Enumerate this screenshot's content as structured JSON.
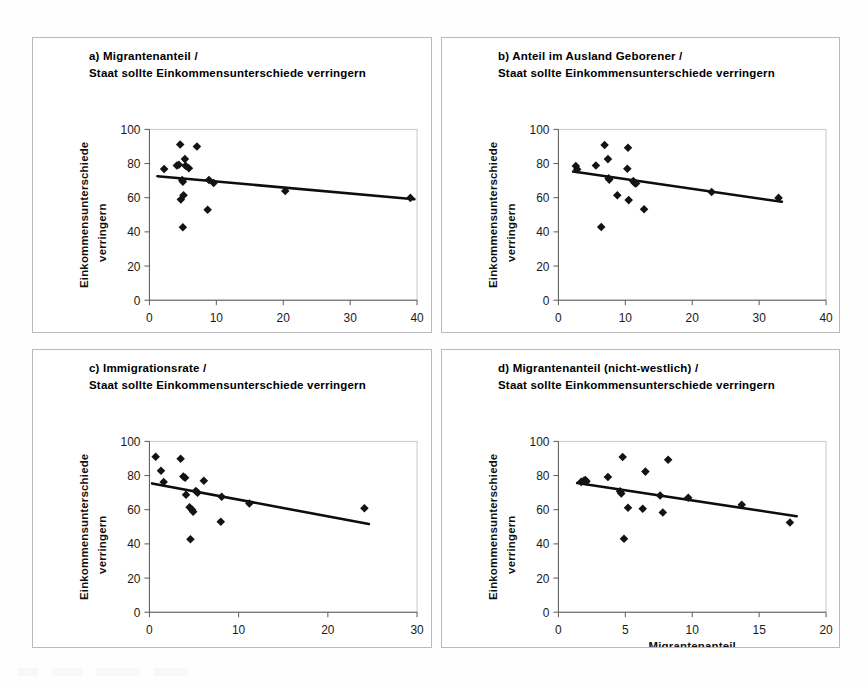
{
  "figure": {
    "background_color": "#ffffff",
    "panel_border_color": "#b9b9b9",
    "marker_color": "#131313",
    "trend_color": "#0d0d0d",
    "axis_color": "#5a5a5a"
  },
  "panels": {
    "a": {
      "title_line1": "a) Migrantenanteil /",
      "title_line2": "Staat sollte Einkommensunterschiede verringern",
      "xlabel": "Migrantenanteil (in %)",
      "ylabel_line1": "Einkommensunterschiede",
      "ylabel_line2": "verringern",
      "xticks": [
        "0",
        "10",
        "20",
        "30",
        "40"
      ],
      "yticks": [
        "0",
        "20",
        "40",
        "60",
        "80",
        "100"
      ]
    },
    "b": {
      "title_line1": "b) Anteil im Ausland Geborener /",
      "title_line2": "Staat sollte Einkommensunterschiede verringern",
      "xlabel": "Anteil im Ausland Geborener (in %)",
      "ylabel_line1": "Einkommensunterschiede",
      "ylabel_line2": "verringern",
      "xticks": [
        "0",
        "10",
        "20",
        "30",
        "40"
      ],
      "yticks": [
        "0",
        "20",
        "40",
        "60",
        "80",
        "100"
      ]
    },
    "c": {
      "title_line1": "c) Immigrationsrate /",
      "title_line2": "Staat sollte Einkommensunterschiede verringern",
      "xlabel": "Immigrationsrate (in ‰)",
      "ylabel_line1": "Einkommensunterschiede",
      "ylabel_line2": "verringern",
      "xticks": [
        "0",
        "10",
        "20",
        "30"
      ],
      "yticks": [
        "0",
        "20",
        "40",
        "60",
        "80",
        "100"
      ]
    },
    "d": {
      "title_line1": "d) Migrantenanteil (nicht-westlich) /",
      "title_line2": "Staat sollte Einkommensunterschiede verringern",
      "xlabel_line1": "Migrantenanteil",
      "xlabel_line2": "Herkunftsländer nicht-westlich (in %)",
      "ylabel_line1": "Einkommensunterschiede",
      "ylabel_line2": "verringern",
      "xticks": [
        "0",
        "5",
        "10",
        "15",
        "20"
      ],
      "yticks": [
        "0",
        "20",
        "40",
        "60",
        "80",
        "100"
      ]
    }
  },
  "chart_data": [
    {
      "id": "a",
      "type": "scatter",
      "title": "a) Migrantenanteil / Staat sollte Einkommensunterschiede verringern",
      "xlabel": "Migrantenanteil (in %)",
      "ylabel": "Einkommensunterschiede verringern",
      "xlim": [
        0,
        40
      ],
      "ylim": [
        0,
        100
      ],
      "xticks": [
        0,
        10,
        20,
        30,
        40
      ],
      "yticks": [
        0,
        20,
        40,
        60,
        80,
        100
      ],
      "grid": false,
      "legend": "none",
      "points": [
        {
          "x": 2.2,
          "y": 76.8
        },
        {
          "x": 4.1,
          "y": 78.8
        },
        {
          "x": 4.4,
          "y": 79.3
        },
        {
          "x": 4.6,
          "y": 91.2
        },
        {
          "x": 4.7,
          "y": 58.9
        },
        {
          "x": 4.9,
          "y": 70.3
        },
        {
          "x": 5.0,
          "y": 69.4
        },
        {
          "x": 5.0,
          "y": 42.7
        },
        {
          "x": 5.1,
          "y": 61.4
        },
        {
          "x": 5.3,
          "y": 82.6
        },
        {
          "x": 5.4,
          "y": 78.7
        },
        {
          "x": 5.9,
          "y": 77.3
        },
        {
          "x": 7.1,
          "y": 90.0
        },
        {
          "x": 8.7,
          "y": 52.9
        },
        {
          "x": 8.9,
          "y": 70.4
        },
        {
          "x": 9.6,
          "y": 68.6
        },
        {
          "x": 20.3,
          "y": 63.9
        },
        {
          "x": 39.0,
          "y": 59.9
        }
      ],
      "trendline": {
        "x0": 1.2,
        "y0": 72.6,
        "x1": 39.6,
        "y1": 59.1
      }
    },
    {
      "id": "b",
      "type": "scatter",
      "title": "b) Anteil im Ausland Geborener / Staat sollte Einkommensunterschiede verringern",
      "xlabel": "Anteil im Ausland Geborener (in %)",
      "ylabel": "Einkommensunterschiede verringern",
      "xlim": [
        0,
        40
      ],
      "ylim": [
        0,
        100
      ],
      "xticks": [
        0,
        10,
        20,
        30,
        40
      ],
      "yticks": [
        0,
        20,
        40,
        60,
        80,
        100
      ],
      "grid": false,
      "legend": "none",
      "points": [
        {
          "x": 2.6,
          "y": 78.6
        },
        {
          "x": 2.8,
          "y": 76.7
        },
        {
          "x": 5.6,
          "y": 78.9
        },
        {
          "x": 6.4,
          "y": 42.8
        },
        {
          "x": 6.9,
          "y": 90.9
        },
        {
          "x": 7.4,
          "y": 82.6
        },
        {
          "x": 7.5,
          "y": 71.4
        },
        {
          "x": 7.6,
          "y": 70.6
        },
        {
          "x": 8.8,
          "y": 61.5
        },
        {
          "x": 10.3,
          "y": 77.0
        },
        {
          "x": 10.4,
          "y": 89.3
        },
        {
          "x": 10.5,
          "y": 58.6
        },
        {
          "x": 11.2,
          "y": 69.7
        },
        {
          "x": 11.4,
          "y": 68.6
        },
        {
          "x": 11.6,
          "y": 68.3
        },
        {
          "x": 12.8,
          "y": 53.3
        },
        {
          "x": 22.9,
          "y": 63.3
        },
        {
          "x": 32.9,
          "y": 59.9
        }
      ],
      "trendline": {
        "x0": 2.2,
        "y0": 75.3,
        "x1": 33.4,
        "y1": 57.6
      }
    },
    {
      "id": "c",
      "type": "scatter",
      "title": "c) Immigrationsrate / Staat sollte Einkommensunterschiede verringern",
      "xlabel": "Immigrationsrate (in ‰)",
      "ylabel": "Einkommensunterschiede verringern",
      "xlim": [
        0,
        30
      ],
      "ylim": [
        0,
        100
      ],
      "xticks": [
        0,
        10,
        20,
        30
      ],
      "yticks": [
        0,
        20,
        40,
        60,
        80,
        100
      ],
      "grid": false,
      "legend": "none",
      "points": [
        {
          "x": 0.7,
          "y": 91.0
        },
        {
          "x": 1.3,
          "y": 82.8
        },
        {
          "x": 1.6,
          "y": 76.2
        },
        {
          "x": 3.5,
          "y": 89.8
        },
        {
          "x": 3.8,
          "y": 79.4
        },
        {
          "x": 4.0,
          "y": 78.7
        },
        {
          "x": 4.1,
          "y": 68.8
        },
        {
          "x": 4.5,
          "y": 61.4
        },
        {
          "x": 4.6,
          "y": 42.7
        },
        {
          "x": 4.8,
          "y": 59.9
        },
        {
          "x": 4.9,
          "y": 58.8
        },
        {
          "x": 5.2,
          "y": 70.9
        },
        {
          "x": 5.4,
          "y": 70.0
        },
        {
          "x": 6.1,
          "y": 77.0
        },
        {
          "x": 8.0,
          "y": 53.0
        },
        {
          "x": 8.1,
          "y": 67.6
        },
        {
          "x": 11.2,
          "y": 63.7
        },
        {
          "x": 24.1,
          "y": 60.9
        }
      ],
      "trendline": {
        "x0": 0.3,
        "y0": 75.4,
        "x1": 24.6,
        "y1": 51.6
      }
    },
    {
      "id": "d",
      "type": "scatter",
      "title": "d) Migrantenanteil (nicht-westlich) / Staat sollte Einkommensunterschiede verringern",
      "xlabel": "Migrantenanteil Herkunftsländer nicht-westlich (in %)",
      "ylabel": "Einkommensunterschiede verringern",
      "xlim": [
        0,
        20
      ],
      "ylim": [
        0,
        100
      ],
      "xticks": [
        0,
        5,
        10,
        15,
        20
      ],
      "yticks": [
        0,
        20,
        40,
        60,
        80,
        100
      ],
      "grid": false,
      "legend": "none",
      "points": [
        {
          "x": 1.7,
          "y": 76.3
        },
        {
          "x": 1.9,
          "y": 77.0
        },
        {
          "x": 2.0,
          "y": 77.4
        },
        {
          "x": 2.1,
          "y": 76.6
        },
        {
          "x": 3.7,
          "y": 79.1
        },
        {
          "x": 4.6,
          "y": 70.8
        },
        {
          "x": 4.7,
          "y": 69.5
        },
        {
          "x": 4.8,
          "y": 90.8
        },
        {
          "x": 4.9,
          "y": 43.0
        },
        {
          "x": 5.2,
          "y": 61.2
        },
        {
          "x": 6.3,
          "y": 60.6
        },
        {
          "x": 6.5,
          "y": 82.3
        },
        {
          "x": 7.6,
          "y": 68.3
        },
        {
          "x": 7.8,
          "y": 58.4
        },
        {
          "x": 8.2,
          "y": 89.2
        },
        {
          "x": 9.7,
          "y": 67.0
        },
        {
          "x": 13.7,
          "y": 62.9
        },
        {
          "x": 17.3,
          "y": 52.5
        }
      ],
      "trendline": {
        "x0": 1.4,
        "y0": 75.6,
        "x1": 17.8,
        "y1": 56.2
      }
    }
  ]
}
